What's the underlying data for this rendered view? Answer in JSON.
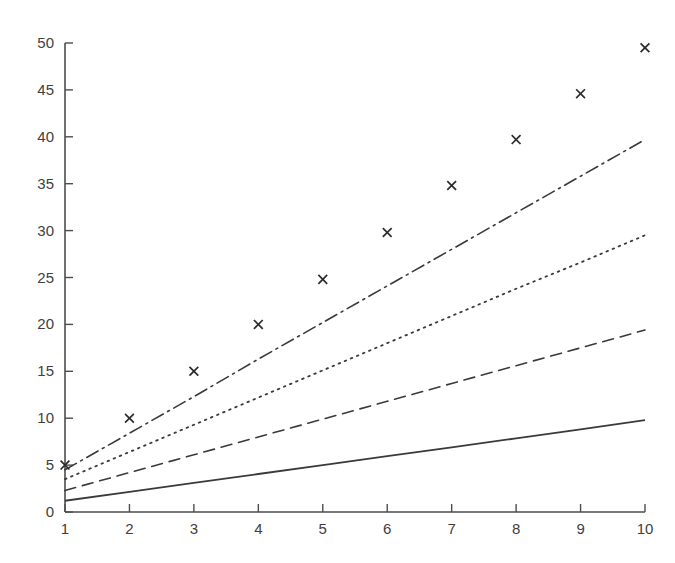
{
  "chart_data": {
    "type": "line",
    "title": "",
    "subtitle": "",
    "xlabel": "",
    "ylabel": "",
    "xlim": [
      1,
      10
    ],
    "ylim": [
      0,
      50
    ],
    "xticks": [
      1,
      2,
      3,
      4,
      5,
      6,
      7,
      8,
      9,
      10
    ],
    "yticks": [
      0,
      5,
      10,
      15,
      20,
      25,
      30,
      35,
      40,
      45,
      50
    ],
    "xticklabels": [
      "1",
      "2",
      "3",
      "4",
      "5",
      "6",
      "7",
      "8",
      "9",
      "10"
    ],
    "yticklabels": [
      "0",
      "5",
      "10",
      "15",
      "20",
      "25",
      "30",
      "35",
      "40",
      "45",
      "50"
    ],
    "grid": false,
    "legend": false,
    "legend_position": "none",
    "background_color": "#ffffff",
    "axis_color": "#4d4d4d",
    "x": [
      1,
      2,
      3,
      4,
      5,
      6,
      7,
      8,
      9,
      10
    ],
    "series": [
      {
        "name": "data-points",
        "style": "scatter",
        "marker": "x",
        "color": "#2b2b2b",
        "values": [
          5.0,
          10.0,
          15.0,
          20.0,
          24.8,
          29.8,
          34.8,
          39.7,
          44.6,
          49.5
        ]
      },
      {
        "name": "dash-dot-line",
        "style": "dashdot",
        "color": "#3a3a3a",
        "values": [
          4.5,
          8.4,
          12.3,
          16.3,
          20.2,
          24.1,
          28.0,
          31.9,
          35.8,
          39.7
        ]
      },
      {
        "name": "dotted-line",
        "style": "dotted",
        "color": "#3a3a3a",
        "values": [
          3.5,
          6.4,
          9.3,
          12.2,
          15.1,
          18.0,
          20.9,
          23.8,
          26.6,
          29.5
        ]
      },
      {
        "name": "dashed-line",
        "style": "dashed",
        "color": "#3a3a3a",
        "values": [
          2.3,
          4.2,
          6.1,
          8.0,
          9.9,
          11.8,
          13.7,
          15.6,
          17.5,
          19.4
        ]
      },
      {
        "name": "solid-line",
        "style": "solid",
        "color": "#3a3a3a",
        "values": [
          1.2,
          2.15,
          3.1,
          4.05,
          5.0,
          5.95,
          6.9,
          7.85,
          8.8,
          9.8
        ]
      }
    ]
  }
}
